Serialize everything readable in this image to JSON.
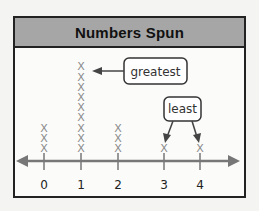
{
  "chart_data": {
    "type": "line plot (dot plot)",
    "title": "Numbers Spun",
    "xlabel": "",
    "ylabel": "",
    "categories": [
      "0",
      "1",
      "2",
      "3",
      "4"
    ],
    "values": [
      3,
      9,
      3,
      1,
      1
    ],
    "marker": "X",
    "annotations": [
      {
        "label": "greatest",
        "points_to": [
          "1"
        ]
      },
      {
        "label": "least",
        "points_to": [
          "3",
          "4"
        ]
      }
    ],
    "grid": false,
    "axis_arrows": true
  },
  "header": {
    "title": "Numbers Spun"
  },
  "axis": {
    "ticks": [
      "0",
      "1",
      "2",
      "3",
      "4"
    ]
  },
  "callouts": {
    "greatest": "greatest",
    "least": "least"
  },
  "colors": {
    "header_bg": "#a6a6a6",
    "axis": "#777777",
    "marks": "#8a8a8a",
    "frame": "#222222"
  }
}
